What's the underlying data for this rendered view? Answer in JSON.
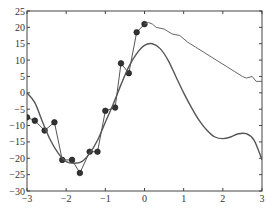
{
  "chart_data": {
    "type": "line",
    "title": "",
    "xlabel": "",
    "ylabel": "",
    "xlim": [
      -3,
      3
    ],
    "ylim": [
      -30,
      25
    ],
    "grid": false,
    "x_ticks": [
      -3,
      -2,
      -1,
      0,
      1,
      2,
      3
    ],
    "y_ticks": [
      25,
      20,
      15,
      10,
      5,
      0,
      -5,
      -10,
      -15,
      -20,
      -25,
      -30
    ],
    "x_tick_labels": [
      "−3",
      "−2",
      "−1",
      "0",
      "1",
      "2",
      "3"
    ],
    "y_tick_labels": [
      "25",
      "20",
      "15",
      "10",
      "5",
      "0",
      "−5",
      "−10",
      "−15",
      "−20",
      "−25",
      "−30"
    ],
    "series": [
      {
        "name": "observations",
        "style": "markers with connecting line",
        "x": [
          -3.0,
          -2.8,
          -2.55,
          -2.3,
          -2.1,
          -1.85,
          -1.65,
          -1.4,
          -1.2,
          -1.0,
          -0.75,
          -0.6,
          -0.4,
          -0.2,
          0.0
        ],
        "y": [
          -7.5,
          -8.5,
          -11.5,
          -9.0,
          -20.5,
          -20.5,
          -24.5,
          -18.0,
          -18.0,
          -5.5,
          -4.5,
          9.0,
          6.0,
          18.5,
          21.0
        ]
      },
      {
        "name": "continuation",
        "style": "thin line",
        "x": [
          0.0,
          0.1,
          0.2,
          0.3,
          0.5,
          0.7,
          0.9,
          1.1,
          1.3,
          1.5,
          1.7,
          1.9,
          2.1,
          2.3,
          2.5,
          2.6,
          2.75,
          2.85,
          3.0
        ],
        "y": [
          21.0,
          21.5,
          21.0,
          20.0,
          19.5,
          18.0,
          17.5,
          15.5,
          14.0,
          12.5,
          11.0,
          9.5,
          8.0,
          6.5,
          5.0,
          4.5,
          5.0,
          3.5,
          3.5
        ]
      },
      {
        "name": "smooth fit",
        "style": "smooth curve",
        "x": [
          -3.0,
          -2.8,
          -2.6,
          -2.4,
          -2.2,
          -2.0,
          -1.8,
          -1.6,
          -1.4,
          -1.2,
          -1.0,
          -0.8,
          -0.6,
          -0.4,
          -0.2,
          0.0,
          0.2,
          0.4,
          0.6,
          0.8,
          1.0,
          1.2,
          1.4,
          1.6,
          1.8,
          2.0,
          2.2,
          2.4,
          2.6,
          2.8,
          3.0
        ],
        "y": [
          0.0,
          -3.0,
          -9.0,
          -14.5,
          -18.5,
          -21.0,
          -21.5,
          -21.0,
          -18.5,
          -14.5,
          -9.0,
          -3.5,
          2.5,
          8.0,
          12.0,
          14.5,
          15.0,
          13.5,
          10.0,
          5.0,
          0.0,
          -4.5,
          -8.5,
          -11.5,
          -13.5,
          -14.0,
          -13.5,
          -12.5,
          -12.5,
          -14.5,
          -20.5
        ]
      }
    ]
  }
}
